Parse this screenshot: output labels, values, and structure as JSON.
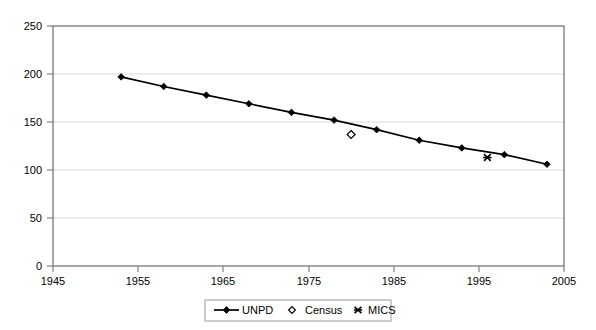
{
  "chart_data": {
    "type": "line",
    "title": "",
    "subtitle": "",
    "xlabel": "",
    "ylabel": "",
    "xlim": [
      1945,
      2005
    ],
    "ylim": [
      0,
      250
    ],
    "grid": "horizontal",
    "legend_position": "bottom",
    "x_ticks": [
      1945,
      1955,
      1965,
      1975,
      1985,
      1995,
      2005
    ],
    "x_tick_labels": [
      "1945",
      "1955",
      "1965",
      "1975",
      "1985",
      "1995",
      "2005"
    ],
    "y_ticks": [
      0,
      50,
      100,
      150,
      200,
      250
    ],
    "y_tick_labels": [
      "0",
      "50",
      "100",
      "150",
      "200",
      "250"
    ],
    "series": [
      {
        "name": "UNPD",
        "marker": "filled-diamond",
        "style": "line-with-markers",
        "color": "#000000",
        "x": [
          1953,
          1958,
          1963,
          1968,
          1973,
          1978,
          1983,
          1988,
          1993,
          1998,
          2003
        ],
        "values": [
          197,
          187,
          178,
          169,
          160,
          152,
          142,
          131,
          123,
          116,
          106
        ]
      },
      {
        "name": "Census",
        "marker": "open-diamond",
        "style": "markers-only",
        "color": "#000000",
        "x": [
          1980
        ],
        "values": [
          137
        ]
      },
      {
        "name": "MICS",
        "marker": "asterisk",
        "style": "markers-only",
        "color": "#000000",
        "x": [
          1996
        ],
        "values": [
          113
        ]
      }
    ]
  },
  "legend": {
    "entries": [
      {
        "label": "UNPD",
        "marker": "line-filled-diamond"
      },
      {
        "label": "Census",
        "marker": "open-diamond"
      },
      {
        "label": "MICS",
        "marker": "asterisk"
      }
    ]
  },
  "colors": {
    "background": "#ffffff",
    "plot_border": "#808080",
    "gridline": "#d9d9d9",
    "series": "#000000",
    "text": "#000000"
  }
}
